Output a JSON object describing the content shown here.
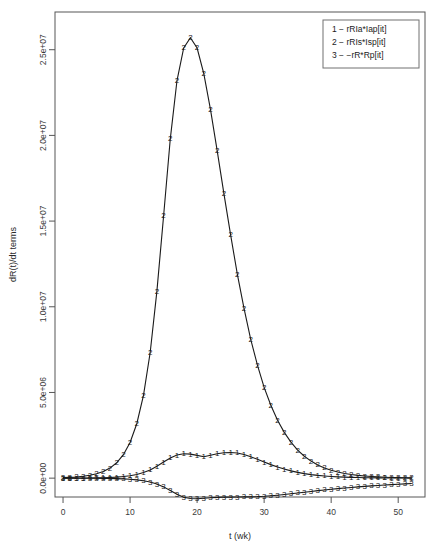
{
  "chart_data": {
    "type": "line",
    "title": "",
    "xlabel": "t (wk)",
    "ylabel": "dR(t)/dt terms",
    "xlim": [
      -1.2,
      54.0
    ],
    "ylim": [
      -1100000,
      27200000
    ],
    "xticks": [
      0,
      10,
      20,
      30,
      40,
      50
    ],
    "xtick_labels": [
      "0",
      "10",
      "20",
      "30",
      "40",
      "50"
    ],
    "yticks": [
      0,
      5000000,
      10000000,
      15000000,
      20000000,
      25000000
    ],
    "ytick_labels": [
      "0.0e+00",
      "5.0e+06",
      "1.0e+07",
      "1.5e+07",
      "2.0e+07",
      "2.5e+07"
    ],
    "grid": false,
    "legend_position": "top-right",
    "legend_entries": [
      "1 − rRIa*Iap[it]",
      "2 − rRIs*Isp[it]",
      "3 − −rR*Rp[it]"
    ],
    "x": [
      0,
      1,
      2,
      3,
      4,
      5,
      6,
      7,
      8,
      9,
      10,
      11,
      12,
      13,
      14,
      15,
      16,
      17,
      18,
      19,
      20,
      21,
      22,
      23,
      24,
      25,
      26,
      27,
      28,
      29,
      30,
      31,
      32,
      33,
      34,
      35,
      36,
      37,
      38,
      39,
      40,
      41,
      42,
      43,
      44,
      45,
      46,
      47,
      48,
      49,
      50,
      51,
      52
    ],
    "series": [
      {
        "name": "1 − rRIa*Iap[it]",
        "marker": "1",
        "values": [
          2000,
          3000,
          4500,
          7000,
          11000,
          17000,
          26000,
          40000,
          61000,
          93000,
          142000,
          215000,
          324000,
          480000,
          690000,
          940000,
          1180000,
          1350000,
          1420000,
          1400000,
          1330000,
          1250000,
          1340000,
          1420000,
          1480000,
          1500000,
          1470000,
          1380000,
          1250000,
          1100000,
          940000,
          790000,
          650000,
          530000,
          425000,
          338000,
          266000,
          208000,
          162000,
          126000,
          97000,
          75000,
          58000,
          44000,
          34000,
          26000,
          20000,
          15000,
          11500,
          8800,
          6700,
          5100,
          3900
        ]
      },
      {
        "name": "2 − rRIs*Isp[it]",
        "marker": "2",
        "values": [
          30000,
          46000,
          70000,
          108000,
          165000,
          252000,
          385000,
          588000,
          897000,
          1368000,
          2085000,
          3175000,
          4830000,
          7330000,
          10900000,
          15300000,
          19800000,
          23200000,
          25100000,
          25700000,
          25100000,
          23600000,
          21500000,
          19100000,
          16600000,
          14200000,
          11900000,
          9900000,
          8100000,
          6600000,
          5300000,
          4250000,
          3380000,
          2670000,
          2100000,
          1640000,
          1280000,
          995000,
          770000,
          595000,
          460000,
          354000,
          272000,
          209000,
          160000,
          123000,
          94000,
          72000,
          55000,
          42000,
          32000,
          24500,
          18800
        ]
      },
      {
        "name": "3 − −rR*Rp[it]",
        "marker": "3",
        "values": [
          -1000,
          -1500,
          -2300,
          -3500,
          -5300,
          -8000,
          -12200,
          -18600,
          -28300,
          -43000,
          -65500,
          -99500,
          -151000,
          -229000,
          -345000,
          -510000,
          -720000,
          -940000,
          -1110000,
          -1190000,
          -1200000,
          -1170000,
          -1140000,
          -1120000,
          -1110000,
          -1105000,
          -1100000,
          -1095000,
          -1090000,
          -1080000,
          -1060000,
          -1030000,
          -995000,
          -955000,
          -910000,
          -865000,
          -820000,
          -775000,
          -730000,
          -690000,
          -650000,
          -612000,
          -576000,
          -542000,
          -510000,
          -480000,
          -452000,
          -425000,
          -400000,
          -376000,
          -354000,
          -333000,
          -313000
        ]
      }
    ]
  },
  "plot_geometry": {
    "left": 55,
    "right": 425,
    "top": 12,
    "bottom": 497
  }
}
